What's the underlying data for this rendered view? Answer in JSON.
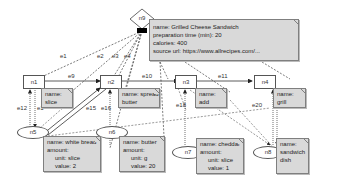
{
  "nodes": {
    "n1": {
      "id": "n1",
      "label": "n1"
    },
    "n2": {
      "id": "n2",
      "label": "n2"
    },
    "n3": {
      "id": "n3",
      "label": "n3"
    },
    "n4": {
      "id": "n4",
      "label": "n4"
    },
    "n5": {
      "id": "n5",
      "label": "n5"
    },
    "n6": {
      "id": "n6",
      "label": "n6"
    },
    "n7": {
      "id": "n7",
      "label": "n7"
    },
    "n8": {
      "id": "n8",
      "label": "n8"
    },
    "n9": {
      "id": "n9",
      "label": "n9"
    }
  },
  "notes": {
    "n9": {
      "l1": "name: Grilled Cheese Sandwich",
      "l2": "preparation time (min): 20",
      "l3": "calories: 400",
      "l4": "source url: https://www.allrecipes.com/..."
    },
    "n1": {
      "l1": "name:",
      "l2": "slice"
    },
    "n2": {
      "l1": "name: spread",
      "l2": "butter"
    },
    "n3": {
      "l1": "name:",
      "l2": "add"
    },
    "n4": {
      "l1": "name:",
      "l2": "grill"
    },
    "n5": {
      "l1": "name: white bread",
      "l2": "amount:",
      "l3": "unit: slice",
      "l4": "value: 2"
    },
    "n6": {
      "l1": "name: butter",
      "l2": "amount:",
      "l3": "unit: g",
      "l4": "value: 20"
    },
    "n7": {
      "l1": "name: cheddar",
      "l2": "amount:",
      "l3": "unit: slice",
      "l4": "value: 1"
    },
    "n8": {
      "l1": "name:",
      "l2": "sandwich",
      "l3": "dish"
    }
  },
  "edges": {
    "e1": "e1",
    "e2": "e2",
    "e3": "e3",
    "e4": "e4",
    "e9": "e9",
    "e10": "e10",
    "e11": "e11",
    "e12": "e12",
    "e13": "e1",
    "e15": "e15",
    "e16": "e16",
    "e18": "e18",
    "e20": "e20"
  },
  "colors": {
    "note_fill": "#d9d9d9",
    "stroke": "#555555",
    "background": "#ffffff"
  }
}
